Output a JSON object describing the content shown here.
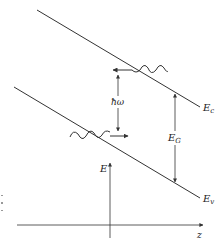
{
  "diagram": {
    "type": "semiconductor energy band diagram (tilted bands under field) with photon emission/absorption",
    "bands": {
      "conduction": {
        "label_main": "E",
        "label_sub": "c"
      },
      "valence": {
        "label_main": "E",
        "label_sub": "v"
      }
    },
    "gap": {
      "label_main": "E",
      "label_sub": "G"
    },
    "photon": {
      "label": "ħω"
    },
    "axes": {
      "y_label": "E",
      "x_label": "z"
    },
    "colors": {
      "line": "#333333",
      "background": "#ffffff"
    }
  }
}
